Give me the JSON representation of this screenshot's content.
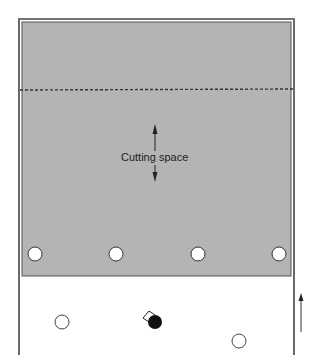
{
  "diagram": {
    "cutting_space_label": "Cutting space",
    "colors": {
      "shaded_area": "#b4b4b4",
      "frame": "#444444",
      "background": "#ffffff",
      "dashed_line": "#333333",
      "player_filled": "#111111"
    },
    "shaded_holes": [
      {
        "cx": 35,
        "cy": 254
      },
      {
        "cx": 116,
        "cy": 254
      },
      {
        "cx": 198,
        "cy": 254
      },
      {
        "cx": 279,
        "cy": 254
      }
    ],
    "open_markers": [
      {
        "cx": 62,
        "cy": 322
      },
      {
        "cx": 239,
        "cy": 341
      }
    ],
    "player": {
      "cx": 155,
      "cy": 322
    },
    "direction_arrow": "up-arrow"
  }
}
